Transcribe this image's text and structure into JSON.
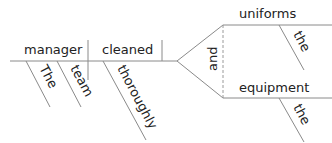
{
  "diagram": {
    "type": "sentence-diagram",
    "sentence": "The team manager cleaned the uniforms and the equipment thoroughly",
    "subject": "manager",
    "subject_modifiers": [
      "The",
      "team"
    ],
    "verb": "cleaned",
    "verb_modifiers": [
      "thoroughly"
    ],
    "conjunction": "and",
    "objects": [
      {
        "word": "uniforms",
        "modifier": "the"
      },
      {
        "word": "equipment",
        "modifier": "the"
      }
    ]
  }
}
